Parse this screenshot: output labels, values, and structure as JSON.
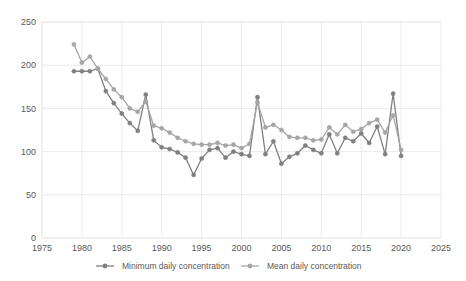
{
  "chart_data": {
    "type": "line",
    "title": "",
    "subtitle": "",
    "xlabel": "",
    "ylabel": "",
    "xlim": [
      1975,
      2025
    ],
    "ylim": [
      0,
      250
    ],
    "y_ticks": [
      0,
      50,
      100,
      150,
      200,
      250
    ],
    "x_ticks": [
      1975,
      1980,
      1985,
      1990,
      1995,
      2000,
      2005,
      2010,
      2015,
      2020,
      2025
    ],
    "grid": true,
    "legend_position": "bottom",
    "x": [
      1979,
      1980,
      1981,
      1982,
      1983,
      1984,
      1985,
      1986,
      1987,
      1988,
      1989,
      1990,
      1991,
      1992,
      1993,
      1994,
      1995,
      1996,
      1997,
      1998,
      1999,
      2000,
      2001,
      2002,
      2003,
      2004,
      2005,
      2006,
      2007,
      2008,
      2009,
      2010,
      2011,
      2012,
      2013,
      2014,
      2015,
      2016,
      2017,
      2018,
      2019,
      2020
    ],
    "series": [
      {
        "name": "Minimum daily concentration",
        "color": "#808080",
        "values": [
          193,
          193,
          193,
          196,
          170,
          156,
          144,
          133,
          124,
          166,
          113,
          105,
          103,
          99,
          93,
          73,
          92,
          102,
          104,
          93,
          100,
          97,
          95,
          163,
          97,
          112,
          86,
          94,
          98,
          107,
          102,
          98,
          120,
          98,
          116,
          112,
          121,
          110,
          129,
          97,
          167,
          95
        ]
      },
      {
        "name": "Mean daily concentration",
        "color": "#a6a6a6",
        "values": [
          224,
          203,
          210,
          196,
          184,
          172,
          163,
          150,
          146,
          158,
          130,
          127,
          122,
          116,
          112,
          109,
          108,
          108,
          110,
          107,
          108,
          104,
          109,
          157,
          128,
          131,
          125,
          117,
          116,
          116,
          113,
          114,
          128,
          120,
          131,
          123,
          126,
          133,
          137,
          122,
          142,
          102
        ]
      }
    ]
  },
  "legend": {
    "items": [
      {
        "label": "Minimum daily concentration",
        "color": "#808080"
      },
      {
        "label": "Mean daily concentration",
        "color": "#a6a6a6"
      }
    ]
  }
}
